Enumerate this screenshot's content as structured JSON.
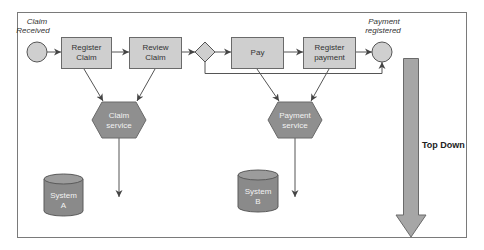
{
  "diagram": {
    "title_annotation": "Top Down",
    "colors": {
      "frame": "#7a7a7a",
      "box_fill": "#cfcfcf",
      "box_stroke": "#6a6a6a",
      "service_fill": "#8f8f8f",
      "db_fill": "#8a8a8a",
      "db_top": "#9c9c9c",
      "arrow_big": "#a6a6a6",
      "line": "#555555"
    },
    "events": {
      "start": {
        "line1": "Claim",
        "line2": "Received"
      },
      "end": {
        "line1": "Payment",
        "line2": "registered"
      }
    },
    "tasks": [
      {
        "line1": "Register",
        "line2": "Claim"
      },
      {
        "line1": "Review",
        "line2": "Claim"
      },
      {
        "line1": "Pay",
        "line2": ""
      },
      {
        "line1": "Register",
        "line2": "payment"
      }
    ],
    "services": [
      {
        "line1": "Claim",
        "line2": "service"
      },
      {
        "line1": "Payment",
        "line2": "service"
      }
    ],
    "systems": [
      {
        "line1": "System",
        "line2": "A"
      },
      {
        "line1": "System",
        "line2": "B"
      }
    ]
  }
}
